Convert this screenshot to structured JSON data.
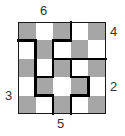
{
  "puzzle": {
    "rows": 5,
    "cols": 5,
    "cell_colors": [
      [
        "gray",
        "white",
        "gray",
        "white",
        "gray"
      ],
      [
        "white",
        "gray",
        "white",
        "gray",
        "white"
      ],
      [
        "gray",
        "white",
        "gray",
        "white",
        "gray"
      ],
      [
        "white",
        "gray",
        "white",
        "gray",
        "white"
      ],
      [
        "gray",
        "white",
        "gray",
        "white",
        "gray"
      ]
    ],
    "colors": {
      "gray": "#a6a6a6",
      "white": "#ffffff",
      "border": "#000000"
    },
    "walls": {
      "vertical": [
        {
          "col": 3,
          "from_row": 0,
          "to_row": 1
        },
        {
          "col": 1,
          "from_row": 1,
          "to_row": 4
        },
        {
          "col": 2,
          "from_row": 1,
          "to_row": 3
        },
        {
          "col": 3,
          "from_row": 2,
          "to_row": 3
        },
        {
          "col": 4,
          "from_row": 3,
          "to_row": 4
        },
        {
          "col": 2,
          "from_row": 4,
          "to_row": 5
        },
        {
          "col": 3,
          "from_row": 4,
          "to_row": 5
        }
      ],
      "horizontal": [
        {
          "row": 1,
          "from_col": 0,
          "to_col": 1
        },
        {
          "row": 1,
          "from_col": 2,
          "to_col": 3
        },
        {
          "row": 2,
          "from_col": 2,
          "to_col": 5
        },
        {
          "row": 3,
          "from_col": 1,
          "to_col": 2
        },
        {
          "row": 3,
          "from_col": 3,
          "to_col": 4
        },
        {
          "row": 4,
          "from_col": 1,
          "to_col": 2
        },
        {
          "row": 4,
          "from_col": 3,
          "to_col": 4
        }
      ]
    },
    "clues": {
      "top": {
        "value": "6",
        "col": 1
      },
      "right_upper": {
        "value": "4",
        "row": 0
      },
      "right_lower": {
        "value": "2",
        "row": 3
      },
      "left": {
        "value": "3",
        "row": 3
      },
      "bottom": {
        "value": "5",
        "col": 2
      }
    }
  }
}
